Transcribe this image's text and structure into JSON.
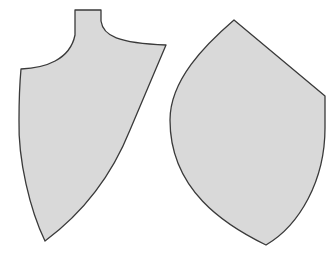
{
  "figure": {
    "fill_color": "#d9d9d9",
    "stroke_color": "#3a3a3a",
    "background": "#ffffff"
  },
  "pieces": [
    {
      "name": "left-pattern-piece",
      "path": "M75,10 L101,10 L101,21 C103,36 118,43 166,45 L130,130 C110,180 80,215 45,241 C30,210 18,160 19,120 C19,95 20,80 21,69 C45,68 70,60 75,35 Z"
    },
    {
      "name": "right-pattern-piece",
      "path": "M234,20 L325,96 L325,128 C325,180 300,225 266,245 C225,225 170,190 170,120 C170,80 205,45 234,20 Z"
    }
  ]
}
